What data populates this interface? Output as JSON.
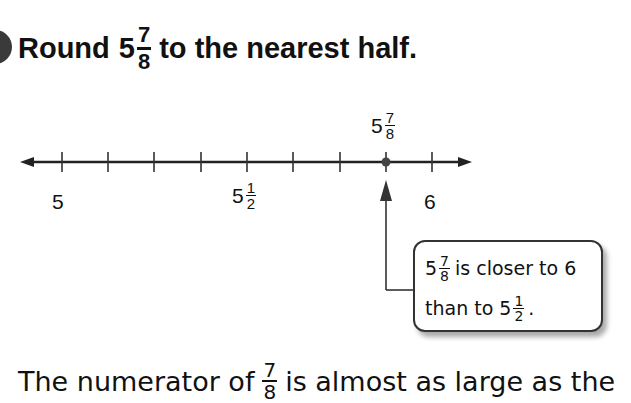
{
  "problem": {
    "title_prefix": "Round",
    "whole": "5",
    "numerator": "7",
    "denominator": "8",
    "title_suffix": "to the nearest half."
  },
  "number_line": {
    "labels": [
      {
        "whole": "5",
        "x": 62
      },
      {
        "whole": "5",
        "numerator": "1",
        "denominator": "2",
        "x": 247
      },
      {
        "whole": "6",
        "x": 432
      }
    ],
    "point": {
      "whole": "5",
      "numerator": "7",
      "denominator": "8",
      "x": 386
    },
    "tick_count": 9
  },
  "callout": {
    "line1_whole": "5",
    "line1_num": "7",
    "line1_den": "8",
    "line1_text": "is closer to 6",
    "line2_text": "than to",
    "line2_whole": "5",
    "line2_num": "1",
    "line2_den": "2",
    "line2_end": "."
  },
  "explanation": {
    "prefix": "The numerator of",
    "num": "7",
    "den": "8",
    "suffix": "is almost as large as the"
  }
}
